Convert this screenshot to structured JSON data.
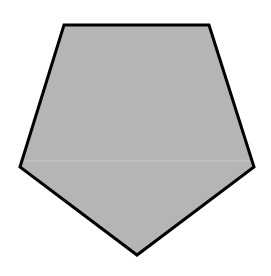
{
  "diagram": {
    "shape": "pentagon",
    "fill_color": "#b5b5b5",
    "stroke_color": "#000000",
    "stroke_width": 3,
    "vertices": [
      [
        64,
        25
      ],
      [
        209,
        25
      ],
      [
        254,
        167
      ],
      [
        137,
        255
      ],
      [
        20,
        167
      ]
    ],
    "seam_line": {
      "y": 161,
      "color": "#c9c9c9"
    }
  }
}
